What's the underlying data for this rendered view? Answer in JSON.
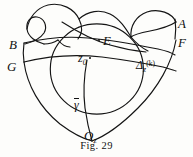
{
  "figure": {
    "caption": "Fig. 29",
    "caption_position": {
      "top": 140
    },
    "background_color": "#fdfdfb",
    "ink_color": "#111111",
    "width": 193,
    "height": 157
  },
  "labels": {
    "b": {
      "text": "B",
      "x": 9,
      "y": 38
    },
    "g": {
      "text": "G",
      "x": 7,
      "y": 60
    },
    "a": {
      "text": "A",
      "x": 178,
      "y": 17
    },
    "f": {
      "text": "F",
      "x": 178,
      "y": 36
    },
    "e": {
      "text": "E",
      "x": 103,
      "y": 34
    },
    "z0": {
      "base": "z",
      "subscript": "0",
      "x": 78,
      "y": 52
    },
    "delta": {
      "base": "Δ",
      "subscript": "z",
      "superscript": "(k)",
      "x": 136,
      "y": 59
    },
    "gamma_bar": {
      "base": "γ",
      "x": 74,
      "y": 98
    },
    "oz": {
      "base": "O",
      "subscript": "z",
      "x": 84,
      "y": 129
    }
  },
  "markers": {
    "e_point": {
      "x": 98,
      "y": 39
    },
    "z0_point": {
      "x": 89,
      "y": 57
    }
  },
  "curves": {
    "outer_left_lobe": "M 27,47 C 30,30 36,18 45,13 C 54,8 63,13 64,22 C 65,31 59,36 56,41",
    "top_middle_lobe": "M 56,41 C 52,26 62,11 78,7 C 96,3 110,13 115,25",
    "right_lobe": "M 115,25 C 124,12 140,5 155,7 C 168,9 175,14 178,20",
    "circle_region": "M 68,30 A 40,38 0 1 0 150,60 A 40,38 0 1 0 68,30",
    "b_edge": "M 24,44 L 24,62",
    "a_edge": "M 175,20 L 175,38",
    "left_fan_upper": "M 24,44 C 50,34 80,32 120,42 C 145,48 165,52 175,55",
    "left_fan_lower": "M 24,62 C 55,55 95,56 130,63 C 152,67 168,70 176,72",
    "left_descender": "M 24,62 C 30,90 55,120 93,140",
    "right_descender": "M 176,40 C 168,75 135,115 93,140",
    "gamma_vertical": "M 86,60 C 84,85 86,115 93,140"
  }
}
